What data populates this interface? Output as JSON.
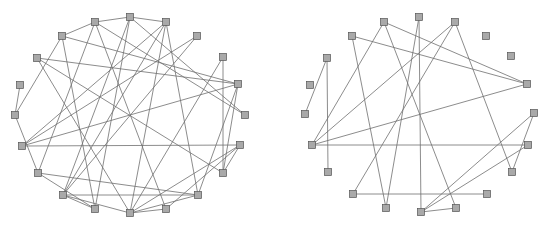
{
  "figure": {
    "panels": [
      {
        "id": "left-graph",
        "description": "Circular-layout graph with 20 nodes (labels illegible at source resolution)",
        "node_size": [
          7,
          7
        ],
        "nodes": [
          {
            "id": "n1",
            "x": 130,
            "y": 17
          },
          {
            "id": "n2",
            "x": 95,
            "y": 22
          },
          {
            "id": "n3",
            "x": 166,
            "y": 22
          },
          {
            "id": "n4",
            "x": 62,
            "y": 36
          },
          {
            "id": "n5",
            "x": 197,
            "y": 36
          },
          {
            "id": "n6",
            "x": 37,
            "y": 58
          },
          {
            "id": "n7",
            "x": 223,
            "y": 57
          },
          {
            "id": "n8",
            "x": 238,
            "y": 84
          },
          {
            "id": "n9",
            "x": 20,
            "y": 85
          },
          {
            "id": "n10",
            "x": 245,
            "y": 115
          },
          {
            "id": "n11",
            "x": 15,
            "y": 115
          },
          {
            "id": "n12",
            "x": 240,
            "y": 145
          },
          {
            "id": "n13",
            "x": 22,
            "y": 146
          },
          {
            "id": "n14",
            "x": 223,
            "y": 173
          },
          {
            "id": "n15",
            "x": 38,
            "y": 173
          },
          {
            "id": "n16",
            "x": 198,
            "y": 195
          },
          {
            "id": "n17",
            "x": 63,
            "y": 195
          },
          {
            "id": "n18",
            "x": 166,
            "y": 209
          },
          {
            "id": "n19",
            "x": 95,
            "y": 209
          },
          {
            "id": "n20",
            "x": 130,
            "y": 213
          }
        ],
        "edges": [
          [
            "n2",
            "n1"
          ],
          [
            "n2",
            "n4"
          ],
          [
            "n2",
            "n10"
          ],
          [
            "n2",
            "n15"
          ],
          [
            "n2",
            "n18"
          ],
          [
            "n1",
            "n3"
          ],
          [
            "n1",
            "n10"
          ],
          [
            "n1",
            "n17"
          ],
          [
            "n1",
            "n19"
          ],
          [
            "n3",
            "n17"
          ],
          [
            "n3",
            "n20"
          ],
          [
            "n3",
            "n13"
          ],
          [
            "n3",
            "n16"
          ],
          [
            "n4",
            "n8"
          ],
          [
            "n4",
            "n11"
          ],
          [
            "n4",
            "n19"
          ],
          [
            "n5",
            "n13"
          ],
          [
            "n5",
            "n17"
          ],
          [
            "n6",
            "n8"
          ],
          [
            "n6",
            "n20"
          ],
          [
            "n6",
            "n14"
          ],
          [
            "n7",
            "n14"
          ],
          [
            "n7",
            "n20"
          ],
          [
            "n8",
            "n13"
          ],
          [
            "n8",
            "n14"
          ],
          [
            "n8",
            "n16"
          ],
          [
            "n9",
            "n11"
          ],
          [
            "n11",
            "n15"
          ],
          [
            "n12",
            "n20"
          ],
          [
            "n12",
            "n18"
          ],
          [
            "n12",
            "n14"
          ],
          [
            "n13",
            "n12"
          ],
          [
            "n15",
            "n16"
          ],
          [
            "n15",
            "n19"
          ],
          [
            "n17",
            "n19"
          ],
          [
            "n17",
            "n16"
          ],
          [
            "n17",
            "n20"
          ],
          [
            "n20",
            "n18"
          ],
          [
            "n20",
            "n16"
          ]
        ]
      },
      {
        "id": "right-graph",
        "description": "Circular-layout graph with 20 nodes, sparser edge set (labels illegible at source resolution)",
        "node_size": [
          7,
          7
        ],
        "nodes": [
          {
            "id": "m1",
            "x": 419,
            "y": 17
          },
          {
            "id": "m2",
            "x": 384,
            "y": 22
          },
          {
            "id": "m3",
            "x": 455,
            "y": 22
          },
          {
            "id": "m4",
            "x": 352,
            "y": 36
          },
          {
            "id": "m5",
            "x": 486,
            "y": 36
          },
          {
            "id": "m6",
            "x": 327,
            "y": 58
          },
          {
            "id": "m7",
            "x": 511,
            "y": 56
          },
          {
            "id": "m8",
            "x": 527,
            "y": 84
          },
          {
            "id": "m9",
            "x": 310,
            "y": 85
          },
          {
            "id": "m10",
            "x": 534,
            "y": 113
          },
          {
            "id": "m11",
            "x": 305,
            "y": 114
          },
          {
            "id": "m12",
            "x": 528,
            "y": 145
          },
          {
            "id": "m13",
            "x": 312,
            "y": 145
          },
          {
            "id": "m14",
            "x": 512,
            "y": 172
          },
          {
            "id": "m15",
            "x": 328,
            "y": 172
          },
          {
            "id": "m16",
            "x": 487,
            "y": 194
          },
          {
            "id": "m17",
            "x": 353,
            "y": 194
          },
          {
            "id": "m18",
            "x": 456,
            "y": 208
          },
          {
            "id": "m19",
            "x": 386,
            "y": 208
          },
          {
            "id": "m20",
            "x": 421,
            "y": 212
          }
        ],
        "edges": [
          [
            "m2",
            "m8"
          ],
          [
            "m2",
            "m18"
          ],
          [
            "m2",
            "m13"
          ],
          [
            "m1",
            "m19"
          ],
          [
            "m1",
            "m20"
          ],
          [
            "m3",
            "m13"
          ],
          [
            "m3",
            "m17"
          ],
          [
            "m3",
            "m14"
          ],
          [
            "m4",
            "m8"
          ],
          [
            "m4",
            "m19"
          ],
          [
            "m6",
            "m11"
          ],
          [
            "m6",
            "m15"
          ],
          [
            "m13",
            "m8"
          ],
          [
            "m13",
            "m12"
          ],
          [
            "m10",
            "m20"
          ],
          [
            "m10",
            "m14"
          ],
          [
            "m12",
            "m20"
          ],
          [
            "m17",
            "m16"
          ],
          [
            "m20",
            "m18"
          ]
        ]
      }
    ],
    "caption": ""
  }
}
